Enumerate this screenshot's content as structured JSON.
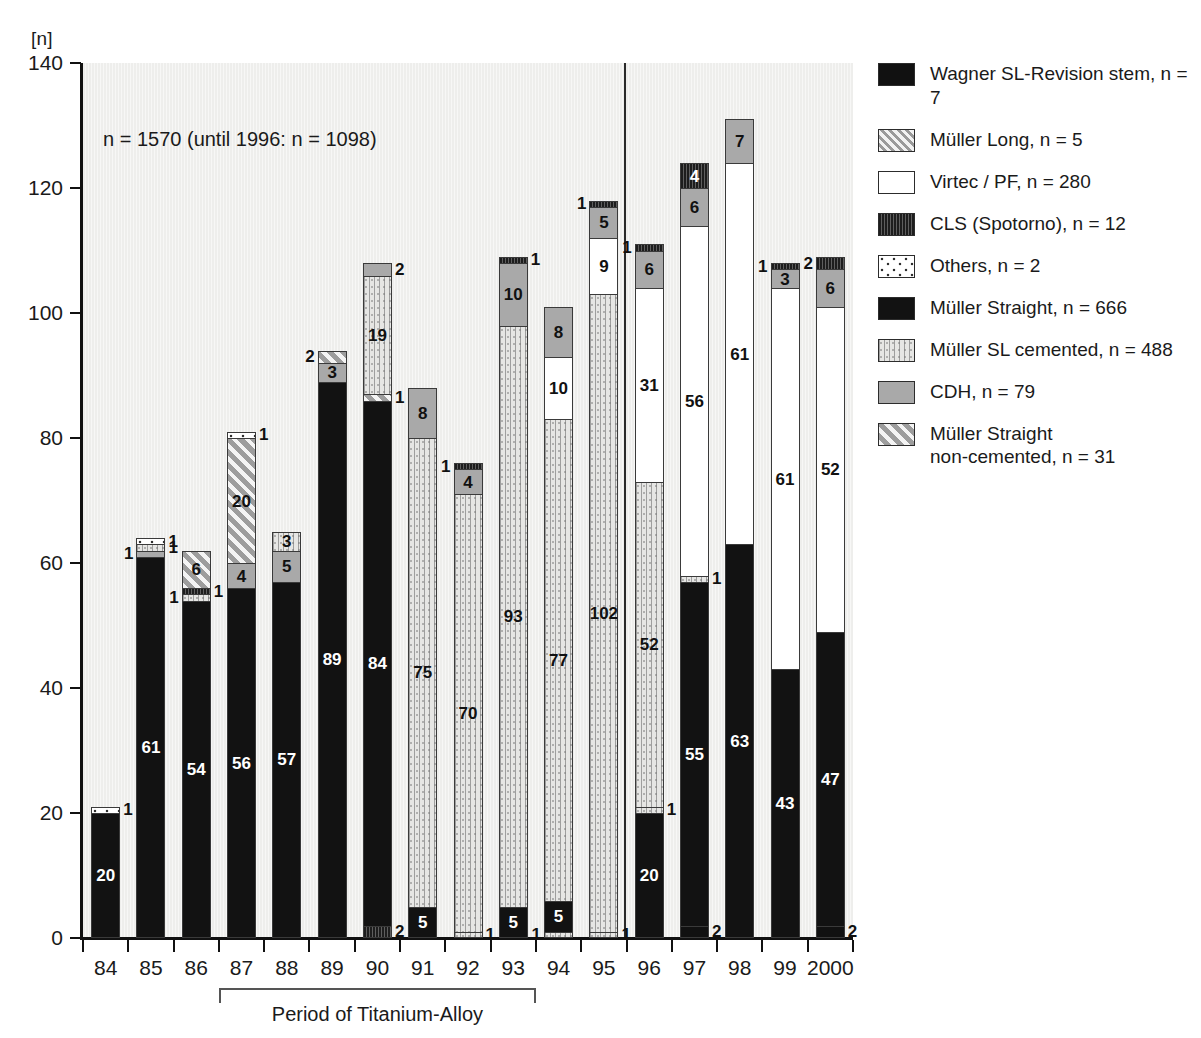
{
  "axis": {
    "unit_label": "[n]",
    "y_ticks": [
      "140",
      "120",
      "100",
      "80",
      "60",
      "40",
      "20",
      "0"
    ],
    "x_labels": [
      "84",
      "85",
      "86",
      "87",
      "88",
      "89",
      "90",
      "91",
      "92",
      "93",
      "94",
      "95",
      "96",
      "97",
      "98",
      "99",
      "2000"
    ]
  },
  "annotation": {
    "n_note": "n = 1570 (until 1996: n = 1098)",
    "bracket_label": "Period of Titanium-Alloy"
  },
  "legend": {
    "items": [
      {
        "key": "wagner",
        "label": "Wagner SL-Revision stem, n = 7"
      },
      {
        "key": "mlong",
        "label": "Müller Long, n = 5"
      },
      {
        "key": "virtec",
        "label": "Virtec / PF, n = 280"
      },
      {
        "key": "cls",
        "label": "CLS (Spotorno), n = 12"
      },
      {
        "key": "others",
        "label": "Others, n = 2"
      },
      {
        "key": "mstr",
        "label": "Müller Straight, n = 666"
      },
      {
        "key": "mslc",
        "label": "Müller SL cemented, n = 488"
      },
      {
        "key": "cdh",
        "label": "CDH, n = 79"
      },
      {
        "key": "msnc",
        "label": "Müller Straight\nnon-cemented, n = 31"
      }
    ]
  },
  "chart_data": {
    "type": "bar",
    "stacked": true,
    "title": "",
    "xlabel": "",
    "ylabel": "[n]",
    "ylim": [
      0,
      140
    ],
    "ytick_step": 20,
    "grid": false,
    "legend_position": "right",
    "total_n": 1570,
    "note": "n = 1570 (until 1996: n = 1098)",
    "series_names": [
      "Wagner SL-Revision stem",
      "Müller Long",
      "Virtec / PF",
      "CLS (Spotorno)",
      "Others",
      "Müller Straight",
      "Müller SL cemented",
      "CDH",
      "Müller Straight non-cemented"
    ],
    "series_totals": [
      7,
      5,
      280,
      12,
      2,
      666,
      488,
      79,
      31
    ],
    "categories": [
      "84",
      "85",
      "86",
      "87",
      "88",
      "89",
      "90",
      "91",
      "92",
      "93",
      "94",
      "95",
      "96",
      "97",
      "98",
      "99",
      "2000"
    ],
    "bars": [
      {
        "year": "84",
        "total": 21,
        "segments": [
          {
            "key": "mstr",
            "value": 20,
            "label": "20",
            "label_pos": "in",
            "text": "white"
          },
          {
            "key": "others",
            "value": 1,
            "label": "1",
            "label_pos": "right",
            "text": "dark"
          }
        ]
      },
      {
        "year": "85",
        "total": 64,
        "segments": [
          {
            "key": "mstr",
            "value": 61,
            "label": "61",
            "label_pos": "in",
            "text": "white"
          },
          {
            "key": "cdh",
            "value": 1,
            "label": "1",
            "label_pos": "left",
            "text": "dark"
          },
          {
            "key": "mslc",
            "value": 1,
            "label": "1",
            "label_pos": "right",
            "text": "dark"
          },
          {
            "key": "others",
            "value": 1,
            "label": "1",
            "label_pos": "right",
            "text": "dark"
          }
        ]
      },
      {
        "year": "86",
        "total": 62,
        "segments": [
          {
            "key": "mstr",
            "value": 54,
            "label": "54",
            "label_pos": "in",
            "text": "white"
          },
          {
            "key": "mslc",
            "value": 1,
            "label": "1",
            "label_pos": "left",
            "text": "dark"
          },
          {
            "key": "cls",
            "value": 1,
            "label": "1",
            "label_pos": "right",
            "text": "dark"
          },
          {
            "key": "msnc",
            "value": 6,
            "label": "6",
            "label_pos": "in",
            "text": "dark"
          }
        ]
      },
      {
        "year": "87",
        "total": 81,
        "segments": [
          {
            "key": "mstr",
            "value": 56,
            "label": "56",
            "label_pos": "in",
            "text": "white"
          },
          {
            "key": "cdh",
            "value": 4,
            "label": "4",
            "label_pos": "in",
            "text": "dark"
          },
          {
            "key": "msnc",
            "value": 20,
            "label": "20",
            "label_pos": "in",
            "text": "dark"
          },
          {
            "key": "others",
            "value": 1,
            "label": "1",
            "label_pos": "right",
            "text": "dark"
          }
        ]
      },
      {
        "year": "88",
        "total": 65,
        "segments": [
          {
            "key": "mstr",
            "value": 57,
            "label": "57",
            "label_pos": "in",
            "text": "white"
          },
          {
            "key": "cdh",
            "value": 5,
            "label": "5",
            "label_pos": "in",
            "text": "dark"
          },
          {
            "key": "mslc",
            "value": 3,
            "label": "3",
            "label_pos": "in",
            "text": "dark"
          }
        ]
      },
      {
        "year": "89",
        "total": 94,
        "segments": [
          {
            "key": "mstr",
            "value": 89,
            "label": "89",
            "label_pos": "in",
            "text": "white"
          },
          {
            "key": "cdh",
            "value": 3,
            "label": "3",
            "label_pos": "in",
            "text": "dark"
          },
          {
            "key": "msnc",
            "value": 2,
            "label": "2",
            "label_pos": "left",
            "text": "dark"
          }
        ]
      },
      {
        "year": "90",
        "total": 108,
        "segments": [
          {
            "key": "cls",
            "value": 2,
            "label": "2",
            "label_pos": "right",
            "text": "dark"
          },
          {
            "key": "mstr",
            "value": 84,
            "label": "84",
            "label_pos": "in",
            "text": "white"
          },
          {
            "key": "msnc",
            "value": 1,
            "label": "1",
            "label_pos": "right",
            "text": "dark"
          },
          {
            "key": "mslc",
            "value": 19,
            "label": "19",
            "label_pos": "in",
            "text": "dark"
          },
          {
            "key": "cdh",
            "value": 2,
            "label": "2",
            "label_pos": "right",
            "text": "dark"
          }
        ]
      },
      {
        "year": "91",
        "total": 88,
        "segments": [
          {
            "key": "mstr",
            "value": 5,
            "label": "5",
            "label_pos": "in",
            "text": "white"
          },
          {
            "key": "mslc",
            "value": 75,
            "label": "75",
            "label_pos": "in",
            "text": "dark"
          },
          {
            "key": "cdh",
            "value": 8,
            "label": "8",
            "label_pos": "in",
            "text": "dark"
          }
        ]
      },
      {
        "year": "92",
        "total": 76,
        "segments": [
          {
            "key": "mslc",
            "value": 1,
            "label": "1",
            "label_pos": "right",
            "text": "dark"
          },
          {
            "key": "mslc",
            "value": 70,
            "label": "70",
            "label_pos": "in",
            "text": "dark"
          },
          {
            "key": "cdh",
            "value": 4,
            "label": "4",
            "label_pos": "in",
            "text": "dark"
          },
          {
            "key": "cls",
            "value": 1,
            "label": "1",
            "label_pos": "left",
            "text": "dark"
          }
        ]
      },
      {
        "year": "93",
        "total": 110,
        "segments": [
          {
            "key": "mstr",
            "value": 5,
            "label": "5",
            "label_pos": "in",
            "text": "white"
          },
          {
            "key": "mslc",
            "value": 93,
            "label": "93",
            "label_pos": "in",
            "text": "dark"
          },
          {
            "key": "cdh",
            "value": 10,
            "label": "10",
            "label_pos": "in",
            "text": "dark"
          },
          {
            "key": "cls",
            "value": 1,
            "label": "1",
            "label_pos": "right",
            "text": "dark"
          }
        ]
      },
      {
        "year": "94",
        "total": 101,
        "segments": [
          {
            "key": "mslc",
            "value": 1,
            "label": "1",
            "label_pos": "left",
            "text": "dark"
          },
          {
            "key": "mstr",
            "value": 5,
            "label": "5",
            "label_pos": "in",
            "text": "white"
          },
          {
            "key": "mslc",
            "value": 77,
            "label": "77",
            "label_pos": "in",
            "text": "dark"
          },
          {
            "key": "virtec",
            "value": 10,
            "label": "10",
            "label_pos": "in",
            "text": "dark"
          },
          {
            "key": "cdh",
            "value": 8,
            "label": "8",
            "label_pos": "in",
            "text": "dark"
          }
        ]
      },
      {
        "year": "95",
        "total": 118,
        "segments": [
          {
            "key": "mslc",
            "value": 1,
            "label": "1",
            "label_pos": "right",
            "text": "dark"
          },
          {
            "key": "mslc",
            "value": 102,
            "label": "102",
            "label_pos": "in",
            "text": "dark"
          },
          {
            "key": "virtec",
            "value": 9,
            "label": "9",
            "label_pos": "in",
            "text": "dark"
          },
          {
            "key": "cdh",
            "value": 5,
            "label": "5",
            "label_pos": "in",
            "text": "dark"
          },
          {
            "key": "cls",
            "value": 1,
            "label": "1",
            "label_pos": "left",
            "text": "dark"
          }
        ]
      },
      {
        "year": "96",
        "total": 111,
        "segments": [
          {
            "key": "mstr",
            "value": 20,
            "label": "20",
            "label_pos": "in",
            "text": "white"
          },
          {
            "key": "mslc",
            "value": 1,
            "label": "1",
            "label_pos": "right",
            "text": "dark"
          },
          {
            "key": "mslc",
            "value": 52,
            "label": "52",
            "label_pos": "in",
            "text": "dark"
          },
          {
            "key": "virtec",
            "value": 31,
            "label": "31",
            "label_pos": "in",
            "text": "dark"
          },
          {
            "key": "cdh",
            "value": 6,
            "label": "6",
            "label_pos": "in",
            "text": "dark"
          },
          {
            "key": "cls",
            "value": 1,
            "label": "1",
            "label_pos": "left",
            "text": "dark"
          }
        ]
      },
      {
        "year": "97",
        "total": 124,
        "segments": [
          {
            "key": "wagner",
            "value": 2,
            "label": "2",
            "label_pos": "right",
            "text": "dark"
          },
          {
            "key": "mstr",
            "value": 55,
            "label": "55",
            "label_pos": "in",
            "text": "white"
          },
          {
            "key": "mslc",
            "value": 1,
            "label": "1",
            "label_pos": "right",
            "text": "dark"
          },
          {
            "key": "virtec",
            "value": 56,
            "label": "56",
            "label_pos": "in",
            "text": "dark"
          },
          {
            "key": "cdh",
            "value": 6,
            "label": "6",
            "label_pos": "in",
            "text": "dark"
          },
          {
            "key": "cls",
            "value": 4,
            "label": "4",
            "label_pos": "in",
            "text": "white"
          }
        ]
      },
      {
        "year": "98",
        "total": 131,
        "segments": [
          {
            "key": "mstr",
            "value": 63,
            "label": "63",
            "label_pos": "in",
            "text": "white"
          },
          {
            "key": "virtec",
            "value": 61,
            "label": "61",
            "label_pos": "in",
            "text": "dark"
          },
          {
            "key": "cdh",
            "value": 7,
            "label": "7",
            "label_pos": "in",
            "text": "dark"
          }
        ]
      },
      {
        "year": "99",
        "total": 108,
        "segments": [
          {
            "key": "mstr",
            "value": 43,
            "label": "43",
            "label_pos": "in",
            "text": "white"
          },
          {
            "key": "virtec",
            "value": 61,
            "label": "61",
            "label_pos": "in",
            "text": "dark"
          },
          {
            "key": "cdh",
            "value": 3,
            "label": "3",
            "label_pos": "in",
            "text": "dark"
          },
          {
            "key": "cls",
            "value": 1,
            "label": "1",
            "label_pos": "left",
            "text": "dark"
          }
        ]
      },
      {
        "year": "2000",
        "total": 109,
        "segments": [
          {
            "key": "wagner",
            "value": 2,
            "label": "2",
            "label_pos": "right",
            "text": "dark"
          },
          {
            "key": "mstr",
            "value": 47,
            "label": "47",
            "label_pos": "in",
            "text": "white"
          },
          {
            "key": "virtec",
            "value": 52,
            "label": "52",
            "label_pos": "in",
            "text": "dark"
          },
          {
            "key": "cdh",
            "value": 6,
            "label": "6",
            "label_pos": "in",
            "text": "dark"
          },
          {
            "key": "cls",
            "value": 2,
            "label": "2",
            "label_pos": "left",
            "text": "dark"
          }
        ]
      }
    ]
  }
}
